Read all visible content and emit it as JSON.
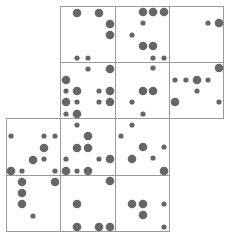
{
  "diagram": {
    "type": "dot-grid-polyomino",
    "colors": {
      "dot": "#666666",
      "grid": "#9a9a9a",
      "background": "#ffffff"
    },
    "grid": {
      "col_edges": [
        6,
        60,
        115,
        169,
        223
      ],
      "row_edges": [
        6,
        62,
        118,
        175,
        231
      ],
      "cells": [
        {
          "row": 0,
          "col": 1
        },
        {
          "row": 0,
          "col": 2
        },
        {
          "row": 0,
          "col": 3
        },
        {
          "row": 1,
          "col": 1
        },
        {
          "row": 1,
          "col": 2
        },
        {
          "row": 1,
          "col": 3
        },
        {
          "row": 2,
          "col": 0
        },
        {
          "row": 2,
          "col": 1
        },
        {
          "row": 2,
          "col": 2
        },
        {
          "row": 3,
          "col": 0
        },
        {
          "row": 3,
          "col": 1
        },
        {
          "row": 3,
          "col": 2
        }
      ]
    },
    "radius": {
      "big": 4.3,
      "small": 2.6
    },
    "dots": [
      [
        77,
        13,
        "b"
      ],
      [
        99,
        13,
        "b"
      ],
      [
        110,
        24,
        "b"
      ],
      [
        110,
        35,
        "b"
      ],
      [
        77,
        58,
        "s"
      ],
      [
        88,
        58,
        "s"
      ],
      [
        143,
        12,
        "b"
      ],
      [
        153,
        12,
        "b"
      ],
      [
        164,
        12,
        "b"
      ],
      [
        143,
        23,
        "s"
      ],
      [
        132,
        35,
        "s"
      ],
      [
        143,
        46,
        "b"
      ],
      [
        153,
        46,
        "b"
      ],
      [
        153,
        58,
        "s"
      ],
      [
        164,
        58,
        "s"
      ],
      [
        208,
        23,
        "s"
      ],
      [
        219,
        23,
        "b"
      ],
      [
        88,
        69,
        "s"
      ],
      [
        110,
        69,
        "b"
      ],
      [
        66,
        80,
        "b"
      ],
      [
        66,
        91,
        "s"
      ],
      [
        77,
        91,
        "b"
      ],
      [
        99,
        91,
        "s"
      ],
      [
        110,
        91,
        "b"
      ],
      [
        66,
        102,
        "b"
      ],
      [
        77,
        102,
        "s"
      ],
      [
        99,
        102,
        "s"
      ],
      [
        110,
        102,
        "b"
      ],
      [
        66,
        114,
        "s"
      ],
      [
        77,
        114,
        "b"
      ],
      [
        153,
        68,
        "s"
      ],
      [
        143,
        91,
        "b"
      ],
      [
        153,
        91,
        "b"
      ],
      [
        132,
        102,
        "s"
      ],
      [
        143,
        114,
        "s"
      ],
      [
        219,
        68,
        "b"
      ],
      [
        175,
        80,
        "s"
      ],
      [
        186,
        80,
        "s"
      ],
      [
        197,
        80,
        "b"
      ],
      [
        208,
        80,
        "s"
      ],
      [
        197,
        91,
        "s"
      ],
      [
        175,
        102,
        "b"
      ],
      [
        219,
        102,
        "s"
      ],
      [
        11,
        136,
        "s"
      ],
      [
        44,
        136,
        "s"
      ],
      [
        55,
        136,
        "s"
      ],
      [
        44,
        148,
        "b"
      ],
      [
        33,
        160,
        "b"
      ],
      [
        44,
        159,
        "s"
      ],
      [
        11,
        171,
        "b"
      ],
      [
        22,
        171,
        "s"
      ],
      [
        55,
        171,
        "s"
      ],
      [
        77,
        125,
        "s"
      ],
      [
        88,
        136,
        "b"
      ],
      [
        77,
        148,
        "b"
      ],
      [
        88,
        148,
        "b"
      ],
      [
        66,
        159,
        "s"
      ],
      [
        99,
        159,
        "s"
      ],
      [
        110,
        159,
        "b"
      ],
      [
        66,
        171,
        "b"
      ],
      [
        77,
        171,
        "s"
      ],
      [
        88,
        171,
        "b"
      ],
      [
        132,
        125,
        "s"
      ],
      [
        121,
        136,
        "s"
      ],
      [
        143,
        147,
        "b"
      ],
      [
        164,
        147,
        "s"
      ],
      [
        132,
        159,
        "b"
      ],
      [
        153,
        158,
        "s"
      ],
      [
        164,
        171,
        "b"
      ],
      [
        22,
        182,
        "b"
      ],
      [
        55,
        182,
        "b"
      ],
      [
        22,
        193,
        "b"
      ],
      [
        22,
        204,
        "b"
      ],
      [
        33,
        216,
        "s"
      ],
      [
        110,
        181,
        "b"
      ],
      [
        77,
        204,
        "b"
      ],
      [
        77,
        227,
        "b"
      ],
      [
        99,
        227,
        "b"
      ],
      [
        110,
        227,
        "b"
      ],
      [
        132,
        204,
        "b"
      ],
      [
        143,
        204,
        "b"
      ],
      [
        164,
        204,
        "s"
      ],
      [
        143,
        215,
        "b"
      ],
      [
        164,
        227,
        "s"
      ]
    ]
  }
}
